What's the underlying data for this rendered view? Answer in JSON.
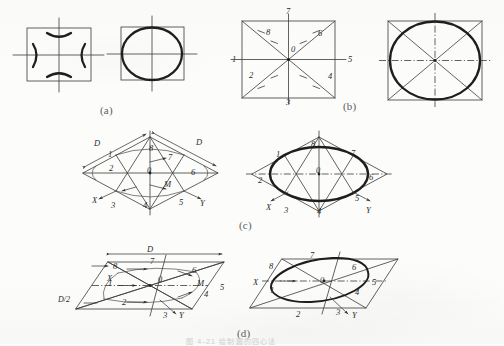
{
  "figure": {
    "background_color": "#fcfcfb",
    "ink_color": "#2b2b2b",
    "panel_labels": [
      {
        "id": "a",
        "text": "(a)",
        "x": 100,
        "y": 104
      },
      {
        "id": "b",
        "text": "(b)",
        "x": 343,
        "y": 100
      },
      {
        "id": "c",
        "text": "(c)",
        "x": 239,
        "y": 219
      },
      {
        "id": "d",
        "text": "(d)",
        "x": 237,
        "y": 327
      }
    ],
    "bottom_caption": "图 4-21  绘制圆的四心法"
  },
  "panels": {
    "a": {
      "name": "front-view-circle-in-square",
      "left_figure": {
        "name": "square-with-four-arcs",
        "description": "square with centre lines and four short arc segments at the midpoints of the sides",
        "arc_count": 4
      },
      "right_figure": {
        "name": "completed-circle-in-square",
        "description": "circle inscribed in square with centre lines"
      }
    },
    "b": {
      "name": "square-with-diagonals-numbered",
      "left_figure": {
        "name": "square-diagonals-eight-points",
        "centre_label": "0",
        "point_labels": [
          "1",
          "2",
          "3",
          "4",
          "5",
          "6",
          "7",
          "8"
        ],
        "labels": [
          {
            "text": "7",
            "x": 297,
            "y": 11
          },
          {
            "text": "8",
            "x": 268,
            "y": 32
          },
          {
            "text": "6",
            "x": 320,
            "y": 33
          },
          {
            "text": "0",
            "x": 293,
            "y": 47
          },
          {
            "text": "1",
            "x": 232,
            "y": 57
          },
          {
            "text": "5",
            "x": 348,
            "y": 57
          },
          {
            "text": "2",
            "x": 249,
            "y": 73
          },
          {
            "text": "4",
            "x": 330,
            "y": 74
          },
          {
            "text": "3",
            "x": 288,
            "y": 94
          }
        ]
      },
      "right_figure": {
        "name": "completed-ellipse-in-square",
        "description": "ellipse inscribed in the square with diagonals and dash-dot centre lines"
      }
    },
    "c": {
      "name": "isometric-rhombus-construction",
      "left_figure": {
        "name": "isometric-rhombus-with-points",
        "dimension_labels": [
          "D",
          "D"
        ],
        "centre_label": "0",
        "midpoint_label": "M",
        "axis_labels": [
          "X",
          "Y"
        ],
        "point_labels": [
          "1",
          "2",
          "3",
          "4",
          "5",
          "6",
          "7",
          "8"
        ],
        "labels": [
          {
            "text": "D",
            "x": 94,
            "y": 141
          },
          {
            "text": "D",
            "x": 196,
            "y": 140
          },
          {
            "text": "1",
            "x": 108,
            "y": 152
          },
          {
            "text": "8",
            "x": 151,
            "y": 146
          },
          {
            "text": "7",
            "x": 169,
            "y": 155
          },
          {
            "text": "0",
            "x": 149,
            "y": 168
          },
          {
            "text": "2",
            "x": 111,
            "y": 166
          },
          {
            "text": "6",
            "x": 192,
            "y": 170
          },
          {
            "text": "M",
            "x": 166,
            "y": 182
          },
          {
            "text": "X",
            "x": 94,
            "y": 198
          },
          {
            "text": "3",
            "x": 112,
            "y": 203
          },
          {
            "text": "4",
            "x": 144,
            "y": 203
          },
          {
            "text": "5",
            "x": 180,
            "y": 200
          },
          {
            "text": "Y",
            "x": 199,
            "y": 201
          }
        ]
      },
      "right_figure": {
        "name": "completed-isometric-ellipse",
        "centre_label": "0",
        "axis_labels": [
          "X",
          "Y"
        ],
        "labels": [
          {
            "text": "8",
            "x": 312,
            "y": 142
          },
          {
            "text": "1",
            "x": 277,
            "y": 152
          },
          {
            "text": "7",
            "x": 352,
            "y": 151
          },
          {
            "text": "0",
            "x": 318,
            "y": 168
          },
          {
            "text": "2",
            "x": 260,
            "y": 178
          },
          {
            "text": "6",
            "x": 369,
            "y": 175
          },
          {
            "text": "5",
            "x": 356,
            "y": 196
          },
          {
            "text": "X",
            "x": 268,
            "y": 205
          },
          {
            "text": "3",
            "x": 285,
            "y": 208
          },
          {
            "text": "4",
            "x": 318,
            "y": 209
          },
          {
            "text": "Y",
            "x": 366,
            "y": 208
          }
        ]
      }
    },
    "d": {
      "name": "oblique-projection-construction",
      "left_figure": {
        "name": "oblique-parallelogram-with-points",
        "dimension_labels": [
          "D",
          "D/2"
        ],
        "centre_label": "0",
        "midpoint_label": "M",
        "axis_labels": [
          "X",
          "Y"
        ],
        "labels": [
          {
            "text": "D",
            "x": 148,
            "y": 248
          },
          {
            "text": "8",
            "x": 114,
            "y": 264
          },
          {
            "text": "7",
            "x": 151,
            "y": 260
          },
          {
            "text": "6",
            "x": 193,
            "y": 268
          },
          {
            "text": "1",
            "x": 109,
            "y": 281
          },
          {
            "text": "0",
            "x": 160,
            "y": 277
          },
          {
            "text": "M",
            "x": 199,
            "y": 281
          },
          {
            "text": "X",
            "x": 94,
            "y": 280
          },
          {
            "text": "5",
            "x": 220,
            "y": 285
          },
          {
            "text": "4",
            "x": 205,
            "y": 292
          },
          {
            "text": "D/2",
            "x": 61,
            "y": 297
          },
          {
            "text": "2",
            "x": 123,
            "y": 300
          },
          {
            "text": "3",
            "x": 164,
            "y": 313
          },
          {
            "text": "Y",
            "x": 180,
            "y": 313
          }
        ]
      },
      "right_figure": {
        "name": "completed-oblique-ellipse",
        "centre_label": "0",
        "axis_labels": [
          "X",
          "Y"
        ],
        "labels": [
          {
            "text": "7",
            "x": 311,
            "y": 253
          },
          {
            "text": "8",
            "x": 270,
            "y": 264
          },
          {
            "text": "6",
            "x": 353,
            "y": 265
          },
          {
            "text": "0",
            "x": 322,
            "y": 278
          },
          {
            "text": "X",
            "x": 255,
            "y": 280
          },
          {
            "text": "5",
            "x": 372,
            "y": 280
          },
          {
            "text": "1",
            "x": 271,
            "y": 288
          },
          {
            "text": "4",
            "x": 356,
            "y": 290
          },
          {
            "text": "2",
            "x": 297,
            "y": 312
          },
          {
            "text": "3",
            "x": 337,
            "y": 310
          },
          {
            "text": "Y",
            "x": 353,
            "y": 313
          }
        ]
      }
    }
  }
}
